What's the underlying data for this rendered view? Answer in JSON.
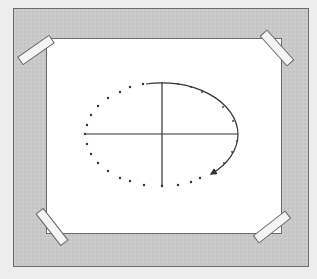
{
  "diagram": {
    "colors": {
      "background": "#ededed",
      "frame_fill": "#c9c9c9",
      "frame_border": "#6a6a6a",
      "paper": "#ffffff",
      "ink": "#333333",
      "tape_fill": "#f4f4f4",
      "tape_border": "#666666"
    },
    "frame": {
      "x": 13,
      "y": 8,
      "width": 295,
      "height": 258
    },
    "paper": {
      "x": 46,
      "y": 38,
      "width": 235,
      "height": 195
    },
    "tapes": [
      {
        "name": "top-left",
        "cx": 36,
        "cy": 50,
        "angle": -35
      },
      {
        "name": "top-right",
        "cx": 277,
        "cy": 48,
        "angle": 45
      },
      {
        "name": "bottom-left",
        "cx": 52,
        "cy": 227,
        "angle": 52
      },
      {
        "name": "bottom-right",
        "cx": 272,
        "cy": 227,
        "angle": -38
      }
    ],
    "axes": {
      "center": [
        162,
        134
      ],
      "horizontal": {
        "x1": 85,
        "x2": 238
      },
      "vertical": {
        "y1": 82,
        "y2": 186
      }
    },
    "ellipse": {
      "cx": 162,
      "cy": 134,
      "rx": 76,
      "ry": 52,
      "solid_segment": "top to lower-right with arrowhead",
      "dotted_segment": "lower-right through bottom and left to top",
      "arrow_tip": [
        211,
        175
      ]
    }
  }
}
